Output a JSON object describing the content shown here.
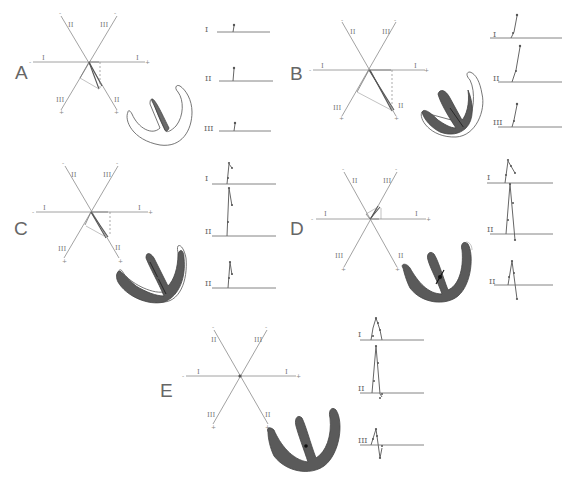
{
  "figure": {
    "panels": [
      {
        "id": "A",
        "letter": "A",
        "axis_labels": {
          "lead_I_left": "I",
          "lead_I_right": "I",
          "lead_II_top": "II",
          "lead_II_bottom": "II",
          "lead_III_top": "III",
          "lead_III_bottom": "III"
        },
        "signs": {
          "neg": "-",
          "pos": "+"
        },
        "ecg_leads": [
          "I",
          "II",
          "III"
        ],
        "activation": "septal"
      },
      {
        "id": "B",
        "letter": "B",
        "axis_labels": {
          "lead_I_left": "I",
          "lead_I_right": "I",
          "lead_II_top": "II",
          "lead_II_bottom": "II",
          "lead_III_top": "III",
          "lead_III_bottom": "III"
        },
        "signs": {
          "neg": "-",
          "pos": "+"
        },
        "ecg_leads": [
          "I",
          "II",
          "III"
        ],
        "activation": "apical"
      },
      {
        "id": "C",
        "letter": "C",
        "axis_labels": {
          "lead_I_left": "I",
          "lead_I_right": "I",
          "lead_II_top": "II",
          "lead_II_bottom": "II",
          "lead_III_top": "III",
          "lead_III_bottom": "III"
        },
        "signs": {
          "neg": "-",
          "pos": "+"
        },
        "ecg_leads": [
          "I",
          "II",
          "III"
        ],
        "activation": "free wall"
      },
      {
        "id": "D",
        "letter": "D",
        "axis_labels": {
          "lead_I_left": "I",
          "lead_I_right": "I",
          "lead_II_top": "II",
          "lead_II_bottom": "II",
          "lead_III_top": "III",
          "lead_III_bottom": "III"
        },
        "signs": {
          "neg": "-",
          "pos": "+"
        },
        "ecg_leads": [
          "I",
          "II",
          "III"
        ],
        "activation": "basal"
      },
      {
        "id": "E",
        "letter": "E",
        "axis_labels": {
          "lead_I_left": "I",
          "lead_I_right": "I",
          "lead_II_top": "II",
          "lead_II_bottom": "II",
          "lead_III_top": "III",
          "lead_III_bottom": "III"
        },
        "signs": {
          "neg": "-",
          "pos": "+"
        },
        "ecg_leads": [
          "I",
          "II",
          "III"
        ],
        "activation": "complete"
      }
    ]
  }
}
